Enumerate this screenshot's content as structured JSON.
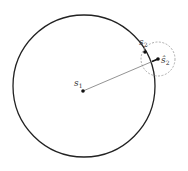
{
  "diagram": {
    "colors": {
      "main_circle": "#222222",
      "dashed_circle": "#999999",
      "segment": "#777777",
      "point": "#111111"
    },
    "main_circle": {
      "cx": 84,
      "cy": 86,
      "r": 71
    },
    "dashed_circle": {
      "cx": 158,
      "cy": 59,
      "r": 17
    },
    "points": [
      {
        "id": "s1",
        "x": 83,
        "y": 91,
        "label": "s",
        "subscript": "1",
        "label_x": 74,
        "label_y": 86
      },
      {
        "id": "s2",
        "x": 145,
        "y": 52,
        "label": "s",
        "subscript": "2",
        "label_x": 139,
        "label_y": 45
      },
      {
        "id": "s2hat",
        "x": 158,
        "y": 59,
        "label": "ŝ",
        "subscript": "2",
        "label_x": 161,
        "label_y": 63
      }
    ]
  }
}
